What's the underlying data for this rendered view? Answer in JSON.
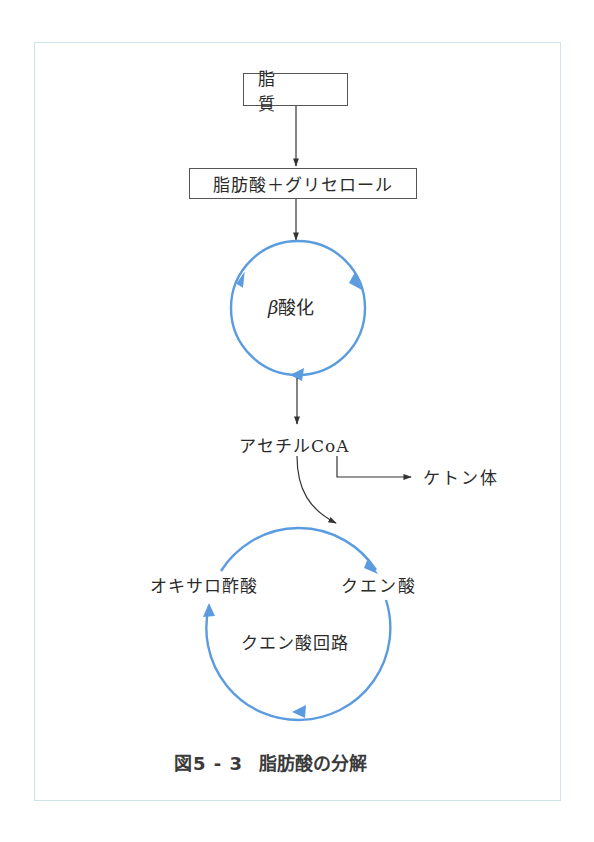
{
  "diagram": {
    "nodes": {
      "lipid": "脂　質",
      "fatty_acid_glycerol": "脂肪酸＋グリセロール",
      "beta_oxidation_symbol": "β",
      "beta_oxidation_text": "酸化",
      "acetyl_coa": "アセチルCoA",
      "ketone_bodies": "ケトン体",
      "oxaloacetic_acid": "オキサロ酢酸",
      "citric_acid": "クエン酸",
      "citric_acid_cycle": "クエン酸回路"
    },
    "edges": [
      {
        "from": "lipid",
        "to": "fatty_acid_glycerol"
      },
      {
        "from": "fatty_acid_glycerol",
        "to": "beta_oxidation"
      },
      {
        "from": "beta_oxidation",
        "to": "acetyl_coa"
      },
      {
        "from": "acetyl_coa",
        "to": "ketone_bodies"
      },
      {
        "from": "acetyl_coa",
        "to": "citric_acid_cycle"
      },
      {
        "from": "oxaloacetic_acid",
        "to": "citric_acid",
        "style": "cycle"
      }
    ],
    "colors": {
      "cycle_blue": "#5b9be0",
      "arrow_black": "#333333",
      "frame": "#cfe3ea"
    }
  },
  "caption": {
    "figure_number": "図5 - 3",
    "title": "脂肪酸の分解"
  }
}
